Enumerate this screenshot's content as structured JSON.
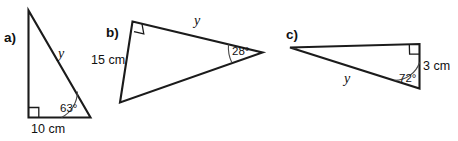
{
  "figure": {
    "background_color": "#ffffff",
    "stroke_color": "#1b1b1b",
    "arc_color": "#4a4a4a",
    "text_color": "#111111"
  },
  "items": [
    {
      "key": "a",
      "part_label": "a)",
      "side_label": "10 cm",
      "angle_label": "63°",
      "variable_label": "y",
      "right_angle": true
    },
    {
      "key": "b",
      "part_label": "b)",
      "side_label": "15 cm",
      "angle_label": "28°",
      "variable_label": "y",
      "right_angle": true
    },
    {
      "key": "c",
      "part_label": "c)",
      "side_label": "3 cm",
      "angle_label": "72°",
      "variable_label": "y",
      "right_angle": true
    }
  ]
}
